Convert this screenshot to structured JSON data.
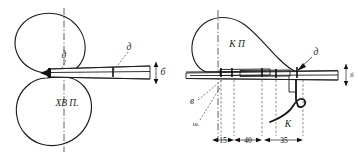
{
  "figure": {
    "background_color": "#ffffff",
    "ink_color": "#1c1c1c",
    "width": 358,
    "height": 160
  },
  "left_view": {
    "name": "left-view",
    "profile_label": "ХВ П.",
    "labels": {
      "upper_inner": "д",
      "upper_outer": "д",
      "right_thickness": "б"
    },
    "centerline": "vertical-dash-dot"
  },
  "right_view": {
    "name": "right-view",
    "profile_label": "К П",
    "labels": {
      "apex": "д",
      "lower_left": "в",
      "lower_left_second": "ш.",
      "hook": "К",
      "right_thickness": "б"
    },
    "dimensions": [
      {
        "value": "15",
        "span_label": "15"
      },
      {
        "value": "40",
        "span_label": "40"
      },
      {
        "value": "35",
        "span_label": "35"
      }
    ],
    "centerline": "vertical-dash-dot"
  },
  "colors": {
    "ink": "#1c1c1c",
    "paper": "#ffffff",
    "dim_ink": "#2a2a2a"
  }
}
